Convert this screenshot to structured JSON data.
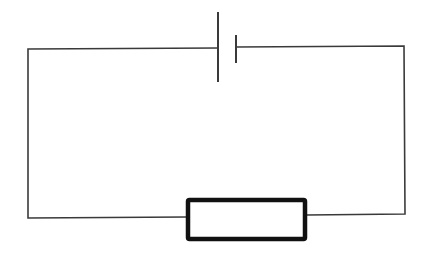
{
  "diagram": {
    "type": "series-circuit",
    "components": [
      {
        "kind": "cell",
        "name": "battery"
      },
      {
        "kind": "resistor",
        "name": "resistor"
      }
    ],
    "colors": {
      "background": "#ffffff",
      "wire": "#3a3a3a",
      "resistor_outline": "#111111"
    }
  }
}
